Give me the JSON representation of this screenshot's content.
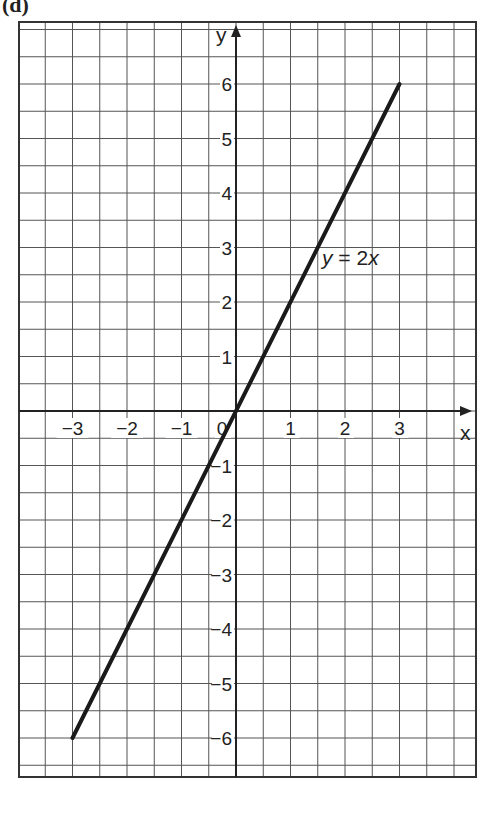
{
  "panel_label": "(d)",
  "chart_data": {
    "type": "line",
    "title": "",
    "xlabel": "x",
    "ylabel": "y",
    "xlim": [
      -4,
      4.4
    ],
    "ylim": [
      -6.8,
      6.6
    ],
    "grid": true,
    "grid_step": 0.5,
    "x_ticks": [
      -3,
      -2,
      -1,
      0,
      1,
      2,
      3
    ],
    "x_tick_labels": [
      "−3",
      "−2",
      "−1",
      "0",
      "1",
      "2",
      "3"
    ],
    "y_ticks": [
      -6,
      -5,
      -4,
      -3,
      -2,
      -1,
      1,
      2,
      3,
      4,
      5,
      6
    ],
    "y_tick_labels": [
      "−6",
      "−5",
      "−4",
      "−3",
      "−2",
      "−1",
      "1",
      "2",
      "3",
      "4",
      "5",
      "6"
    ],
    "series": [
      {
        "name": "y = 2x",
        "x": [
          -3,
          3
        ],
        "y": [
          -6,
          6
        ]
      }
    ],
    "annotations": [
      {
        "text": "y = 2x",
        "x": 1.6,
        "y": 3
      }
    ]
  },
  "labels": {
    "x_axis": "x",
    "y_axis": "y",
    "equation_italic": "y",
    "equation_rest": " = 2",
    "equation_x": "x"
  }
}
